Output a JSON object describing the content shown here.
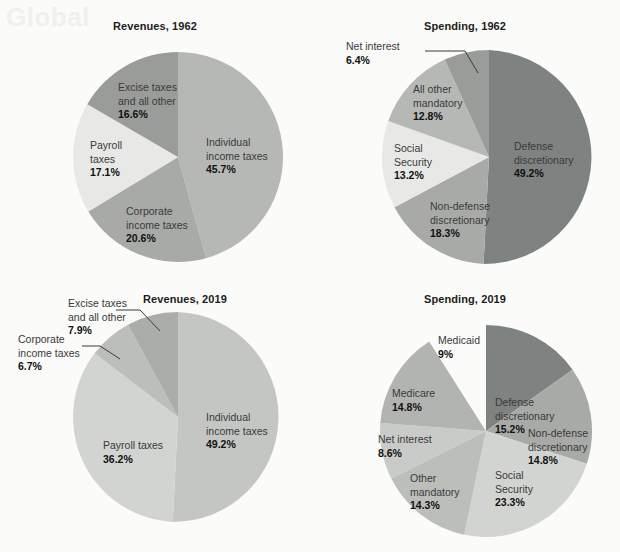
{
  "page": {
    "background": "#fbfbfa",
    "ghost_text": "Global"
  },
  "charts": [
    {
      "id": "revenues-1962",
      "title": "Revenues, 1962",
      "slices": [
        {
          "label": "Individual\nincome taxes",
          "value": "45.7%",
          "color": "#b6b8b5"
        },
        {
          "label": "Corporate\nincome taxes",
          "value": "20.6%",
          "color": "#a8aaa7"
        },
        {
          "label": "Payroll\ntaxes",
          "value": "17.1%",
          "color": "#e8e9e6"
        },
        {
          "label": "Excise taxes\nand all other",
          "value": "16.6%",
          "color": "#9a9c99"
        }
      ]
    },
    {
      "id": "spending-1962",
      "title": "Spending, 1962",
      "slices": [
        {
          "label": "Defense\ndiscretionary",
          "value": "49.2%",
          "color": "#7e8280"
        },
        {
          "label": "Non-defense\ndiscretionary",
          "value": "18.3%",
          "color": "#a8aaa7"
        },
        {
          "label": "Social\nSecurity",
          "value": "13.2%",
          "color": "#e8e9e6"
        },
        {
          "label": "All other\nmandatory",
          "value": "12.8%",
          "color": "#b6b8b5"
        },
        {
          "label": "Net interest",
          "value": "6.4%",
          "color": "#9a9c99"
        }
      ]
    },
    {
      "id": "revenues-2019",
      "title": "Revenues, 2019",
      "slices": [
        {
          "label": "Individual\nincome taxes",
          "value": "49.2%",
          "color": "#c4c6c3"
        },
        {
          "label": "Payroll taxes",
          "value": "36.2%",
          "color": "#d2d4d1"
        },
        {
          "label": "Corporate\nincome taxes",
          "value": "6.7%",
          "color": "#bcbeba"
        },
        {
          "label": "Excise taxes\nand all other",
          "value": "7.9%",
          "color": "#abada9"
        }
      ]
    },
    {
      "id": "spending-2019",
      "title": "Spending, 2019",
      "slices": [
        {
          "label": "Defense\ndiscretionary",
          "value": "15.2%",
          "color": "#7e8280"
        },
        {
          "label": "Non-defense\ndiscretionary",
          "value": "14.8%",
          "color": "#a8aaa7"
        },
        {
          "label": "Social\nSecurity",
          "value": "23.3%",
          "color": "#d2d4d1"
        },
        {
          "label": "Other\nmandatory",
          "value": "14.3%",
          "color": "#bcbeba"
        },
        {
          "label": "Net interest",
          "value": "8.6%",
          "color": "#c9cbc8"
        },
        {
          "label": "Medicare",
          "value": "14.8%",
          "color": "#b2b4b1"
        },
        {
          "label": "Medicaid",
          "value": "9%",
          "color": "#fbfbfa"
        }
      ]
    }
  ],
  "chart_data": [
    {
      "type": "pie",
      "title": "Revenues, 1962",
      "categories": [
        "Individual income taxes",
        "Corporate income taxes",
        "Payroll taxes",
        "Excise taxes and all other"
      ],
      "values": [
        45.7,
        20.6,
        17.1,
        16.6
      ],
      "unit": "percent",
      "legend": "in-slice labels",
      "start_angle_deg": 0,
      "direction": "clockwise"
    },
    {
      "type": "pie",
      "title": "Spending, 1962",
      "categories": [
        "Defense discretionary",
        "Non-defense discretionary",
        "Social Security",
        "All other mandatory",
        "Net interest"
      ],
      "values": [
        49.2,
        18.3,
        13.2,
        12.8,
        6.4
      ],
      "unit": "percent",
      "legend": "in-slice labels with leader line for Net interest",
      "start_angle_deg": 0,
      "direction": "clockwise"
    },
    {
      "type": "pie",
      "title": "Revenues, 2019",
      "categories": [
        "Individual income taxes",
        "Payroll taxes",
        "Corporate income taxes",
        "Excise taxes and all other"
      ],
      "values": [
        49.2,
        36.2,
        6.7,
        7.9
      ],
      "unit": "percent",
      "legend": "in-slice labels with leader lines for Corporate income taxes and Excise taxes and all other",
      "start_angle_deg": 0,
      "direction": "clockwise"
    },
    {
      "type": "pie",
      "title": "Spending, 2019",
      "categories": [
        "Defense discretionary",
        "Non-defense discretionary",
        "Social Security",
        "Other mandatory",
        "Net interest",
        "Medicare",
        "Medicaid"
      ],
      "values": [
        15.2,
        14.8,
        23.3,
        14.3,
        8.6,
        14.8,
        9.0
      ],
      "unit": "percent",
      "legend": "in-slice labels",
      "start_angle_deg": 0,
      "direction": "clockwise"
    }
  ]
}
